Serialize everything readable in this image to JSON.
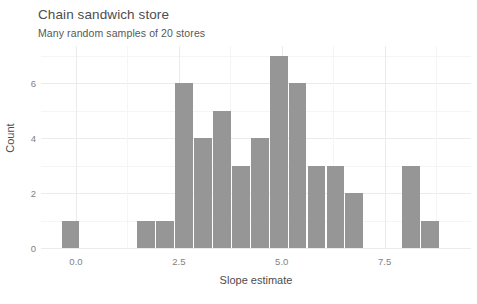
{
  "chart_data": {
    "type": "bar",
    "title": "Chain sandwich store",
    "subtitle": "Many random samples of 20 stores",
    "xlabel": "Slope estimate",
    "ylabel": "Count",
    "xlim": [
      -0.85,
      9.6
    ],
    "ylim": [
      0,
      7.35
    ],
    "grid": true,
    "legend": false,
    "bin_width": 0.46,
    "xticks": [
      {
        "value": 0.0,
        "label": "0.0"
      },
      {
        "value": 2.5,
        "label": "2.5"
      },
      {
        "value": 5.0,
        "label": "5.0"
      },
      {
        "value": 7.5,
        "label": "7.5"
      }
    ],
    "xticks_minor": [
      1.25,
      3.75,
      6.25,
      8.75
    ],
    "yticks": [
      {
        "value": 0,
        "label": "0"
      },
      {
        "value": 2,
        "label": "2"
      },
      {
        "value": 4,
        "label": "4"
      },
      {
        "value": 6,
        "label": "6"
      }
    ],
    "yticks_minor": [
      1,
      3,
      5,
      7
    ],
    "bar_color": "#969696",
    "bins": [
      {
        "x0": -0.35,
        "x1": 0.11,
        "count": 1
      },
      {
        "x0": 1.49,
        "x1": 1.95,
        "count": 1
      },
      {
        "x0": 1.95,
        "x1": 2.41,
        "count": 1
      },
      {
        "x0": 2.41,
        "x1": 2.87,
        "count": 6
      },
      {
        "x0": 2.87,
        "x1": 3.33,
        "count": 4
      },
      {
        "x0": 3.33,
        "x1": 3.79,
        "count": 5
      },
      {
        "x0": 3.79,
        "x1": 4.25,
        "count": 3
      },
      {
        "x0": 4.25,
        "x1": 4.71,
        "count": 4
      },
      {
        "x0": 4.71,
        "x1": 5.17,
        "count": 7
      },
      {
        "x0": 5.17,
        "x1": 5.63,
        "count": 6
      },
      {
        "x0": 5.63,
        "x1": 6.09,
        "count": 3
      },
      {
        "x0": 6.09,
        "x1": 6.55,
        "count": 3
      },
      {
        "x0": 6.55,
        "x1": 7.01,
        "count": 2
      },
      {
        "x0": 7.93,
        "x1": 8.39,
        "count": 3
      },
      {
        "x0": 8.39,
        "x1": 8.85,
        "count": 1
      }
    ]
  }
}
